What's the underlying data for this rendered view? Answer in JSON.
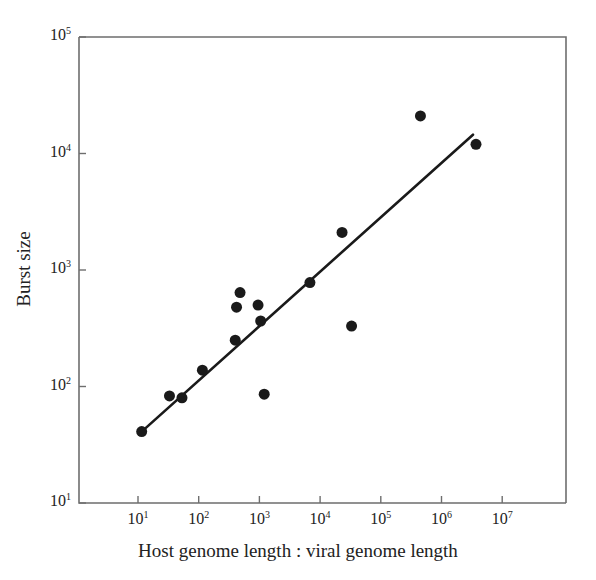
{
  "chart_data": {
    "type": "scatter",
    "title": "",
    "xlabel": "Host genome length : viral genome length",
    "ylabel": "Burst size",
    "xscale": "log",
    "yscale": "log",
    "xlim": [
      3.2,
      31600000
    ],
    "ylim": [
      10,
      100000
    ],
    "grid": false,
    "legend": null,
    "xticks": [
      {
        "value": 10,
        "label": "10",
        "exp": "1"
      },
      {
        "value": 100,
        "label": "10",
        "exp": "2"
      },
      {
        "value": 1000,
        "label": "10",
        "exp": "3"
      },
      {
        "value": 10000,
        "label": "10",
        "exp": "4"
      },
      {
        "value": 100000,
        "label": "10",
        "exp": "5"
      },
      {
        "value": 1000000,
        "label": "10",
        "exp": "6"
      },
      {
        "value": 10000000,
        "label": "10",
        "exp": "7"
      }
    ],
    "yticks": [
      {
        "value": 10,
        "label": "10",
        "exp": "1"
      },
      {
        "value": 100,
        "label": "10",
        "exp": "2"
      },
      {
        "value": 1000,
        "label": "10",
        "exp": "3"
      },
      {
        "value": 10000,
        "label": "10",
        "exp": "4"
      },
      {
        "value": 100000,
        "label": "10",
        "exp": "5"
      }
    ],
    "series": [
      {
        "name": "observations",
        "marker": "filled-circle",
        "marker_color": "#1a1a1a",
        "marker_size": 11,
        "points": [
          {
            "x": 11.5,
            "y": 41
          },
          {
            "x": 33,
            "y": 83
          },
          {
            "x": 53,
            "y": 80
          },
          {
            "x": 115,
            "y": 138
          },
          {
            "x": 400,
            "y": 250
          },
          {
            "x": 420,
            "y": 480
          },
          {
            "x": 480,
            "y": 640
          },
          {
            "x": 950,
            "y": 500
          },
          {
            "x": 1050,
            "y": 365
          },
          {
            "x": 1200,
            "y": 86
          },
          {
            "x": 6800,
            "y": 780
          },
          {
            "x": 23000,
            "y": 2100
          },
          {
            "x": 33000,
            "y": 330
          },
          {
            "x": 450000,
            "y": 21000
          },
          {
            "x": 3700000,
            "y": 12000
          }
        ]
      }
    ],
    "fit_line": {
      "name": "regression-line",
      "color": "#1a1a1a",
      "width": 2.6,
      "x_start": 11.5,
      "y_start": 41,
      "x_end": 3300000,
      "y_end": 14500
    },
    "axes": {
      "frame_color": "#6e6e6e",
      "frame_width": 1.6,
      "tick_color": "#6e6e6e",
      "tick_length": 7,
      "tick_side": "inside-x-outside-y"
    }
  }
}
